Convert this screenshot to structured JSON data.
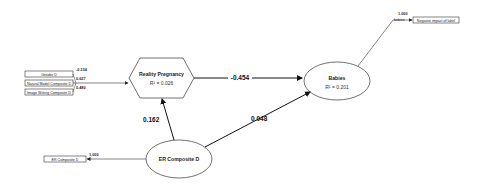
{
  "diagram": {
    "type": "structural-equation-model",
    "constructs": {
      "reality_pregnancy": {
        "name": "Reality Pregnancy",
        "r2": "R² = 0.026"
      },
      "babies": {
        "name": "Babies",
        "r2": "R² = 0.201"
      },
      "er_composite": {
        "name": "ER Composite D"
      }
    },
    "indicators": {
      "gender": {
        "label": "Gender D",
        "loading": "-0.134"
      },
      "natural_model": {
        "label": "Natural Model Composite D",
        "loading": "0.627"
      },
      "image_writing": {
        "label": "Image Writing Composite D",
        "loading": "0.480"
      },
      "er_indicator": {
        "label": "ER Composite D",
        "loading": "1.000"
      },
      "babies_indicator": {
        "label": "Negative impact of label",
        "prefix": "babies",
        "loading": "1.000"
      }
    },
    "paths": {
      "rp_to_babies": "-0.454",
      "er_to_rp": "0.162",
      "er_to_babies": "0.048"
    }
  }
}
